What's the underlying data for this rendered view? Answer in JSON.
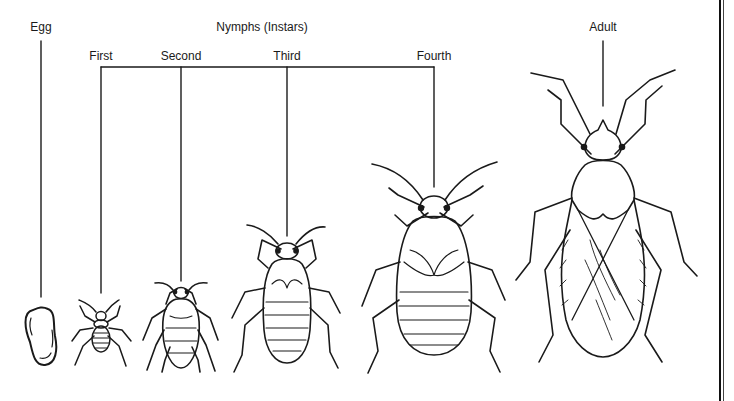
{
  "diagram": {
    "labels": {
      "egg": "Egg",
      "nymphs_group": "Nymphs (Instars)",
      "first": "First",
      "second": "Second",
      "third": "Third",
      "fourth": "Fourth",
      "adult": "Adult"
    },
    "stages": [
      {
        "id": "egg",
        "label": "Egg"
      },
      {
        "id": "first-instar",
        "label": "First"
      },
      {
        "id": "second-instar",
        "label": "Second"
      },
      {
        "id": "third-instar",
        "label": "Third"
      },
      {
        "id": "fourth-instar",
        "label": "Fourth"
      },
      {
        "id": "adult",
        "label": "Adult"
      }
    ],
    "colors": {
      "line": "#1a1a1a",
      "background": "#ffffff"
    }
  }
}
